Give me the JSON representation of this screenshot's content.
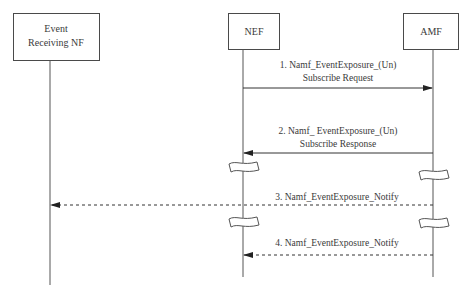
{
  "diagram": {
    "type": "sequence",
    "participants": [
      {
        "id": "ernf",
        "label_lines": [
          "Event",
          "Receiving NF"
        ]
      },
      {
        "id": "nef",
        "label_lines": [
          "NEF"
        ]
      },
      {
        "id": "amf",
        "label_lines": [
          "AMF"
        ]
      }
    ],
    "messages": [
      {
        "number": "1",
        "from": "nef",
        "to": "amf",
        "style": "solid",
        "label_lines": [
          "1. Namf_EventExposure_(Un)",
          "Subscribe Request"
        ]
      },
      {
        "number": "2",
        "from": "amf",
        "to": "nef",
        "style": "solid",
        "label_lines": [
          "2. Namf_ EventExposure_(Un)",
          "Subscribe Response"
        ]
      },
      {
        "number": "3",
        "from": "amf",
        "to": "ernf",
        "style": "dashed",
        "label_lines": [
          "3. Namf_EventExposure_Notify"
        ]
      },
      {
        "number": "4",
        "from": "amf",
        "to": "nef",
        "style": "dashed",
        "label_lines": [
          "4. Namf_EventExposure_Notify"
        ]
      }
    ],
    "colors": {
      "line": "#3a3a3a",
      "background": "#ffffff"
    }
  }
}
